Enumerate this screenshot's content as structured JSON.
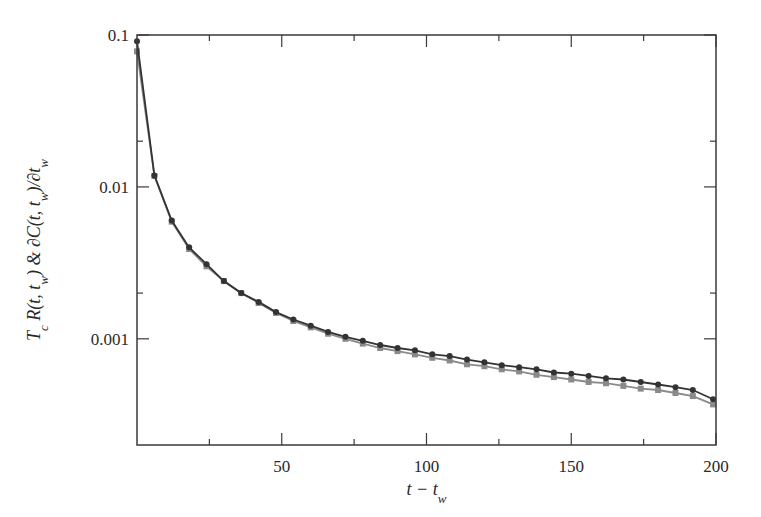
{
  "chart_data": {
    "type": "line",
    "title": "",
    "xlabel": "t − t_w",
    "ylabel": "T_c R(t, t_w) & ∂C(t, t_w)/∂t_w",
    "xlim": [
      0,
      200
    ],
    "ylim": [
      0.0002,
      0.1
    ],
    "yscale": "log",
    "grid": false,
    "legend": null,
    "x_ticks": [
      50,
      100,
      150,
      200
    ],
    "x_tick_labels": [
      "50",
      "100",
      "150",
      "200"
    ],
    "x_minor_ticks": [
      25,
      75,
      125,
      175
    ],
    "y_ticks": [
      0.1,
      0.01,
      0.001
    ],
    "y_tick_labels": [
      "0.1",
      "0.01",
      "0.001"
    ],
    "y_minor_ticks": [
      0.02,
      0.002
    ],
    "x": [
      0,
      6,
      12,
      18,
      24,
      30,
      36,
      42,
      48,
      54,
      60,
      66,
      72,
      78,
      84,
      90,
      96,
      102,
      108,
      114,
      120,
      126,
      132,
      138,
      144,
      150,
      156,
      162,
      168,
      174,
      180,
      186,
      192,
      199
    ],
    "series": [
      {
        "name": "T_c R(t, t_w)",
        "color": "#333333",
        "marker": "circle",
        "values": [
          0.091,
          0.0119,
          0.006,
          0.004,
          0.0031,
          0.0024,
          0.002,
          0.00175,
          0.0015,
          0.00134,
          0.00122,
          0.00111,
          0.00103,
          0.00097,
          0.00091,
          0.00087,
          0.00084,
          0.00079,
          0.00077,
          0.00073,
          0.0007,
          0.00067,
          0.00065,
          0.00063,
          0.0006,
          0.00059,
          0.00057,
          0.00055,
          0.00054,
          0.00052,
          0.0005,
          0.00048,
          0.00046,
          0.0004
        ]
      },
      {
        "name": "∂C(t, t_w)/∂t_w",
        "color": "#8a8a8a",
        "marker": "square",
        "values": [
          0.078,
          0.0118,
          0.0059,
          0.0039,
          0.003,
          0.0024,
          0.002,
          0.00172,
          0.00148,
          0.00131,
          0.00119,
          0.00108,
          0.001,
          0.00093,
          0.00087,
          0.00083,
          0.00079,
          0.00075,
          0.00072,
          0.00068,
          0.00066,
          0.00063,
          0.00061,
          0.00058,
          0.00056,
          0.00054,
          0.00052,
          0.00051,
          0.00049,
          0.00047,
          0.00046,
          0.00044,
          0.00042,
          0.00037
        ]
      }
    ]
  },
  "plot_area": {
    "left": 137,
    "top": 35,
    "right": 716,
    "bottom": 445
  }
}
